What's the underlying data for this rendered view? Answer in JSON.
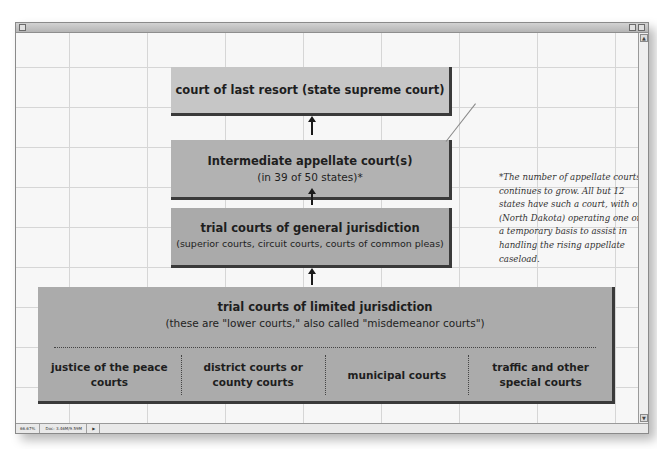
{
  "window": {
    "status_zoom": "66.67%",
    "status_doc": "Doc: 3.46M/9.59M"
  },
  "diagram": {
    "levels": [
      {
        "id": "top",
        "title": "court of last resort (state supreme court)",
        "subtitle": ""
      },
      {
        "id": "appellate",
        "title": "Intermediate appellate court(s)",
        "subtitle": "(in 39 of 50 states)*"
      },
      {
        "id": "general",
        "title": "trial courts of general jurisdiction",
        "subtitle": "(superior courts, circuit courts, courts of common pleas)"
      },
      {
        "id": "limited",
        "title": "trial courts of limited jurisdiction",
        "subtitle": "(these are \"lower courts,\" also called \"misdemeanor courts\")",
        "subcourts": [
          "justice of the peace courts",
          "district courts or county courts",
          "municipal courts",
          "traffic and other special courts"
        ]
      }
    ],
    "footnote": "*The number of appellate courts continues to grow. All but 12 states have such a court, with one (North Dakota) operating one on a temporary basis to assist in handling the rising appellate caseload.",
    "colors": {
      "top": "#c6c6c6",
      "appellate": "#b2b2b2",
      "general": "#aaaaaa",
      "limited": "#ababab",
      "shadow": "#3a3a3a"
    }
  }
}
